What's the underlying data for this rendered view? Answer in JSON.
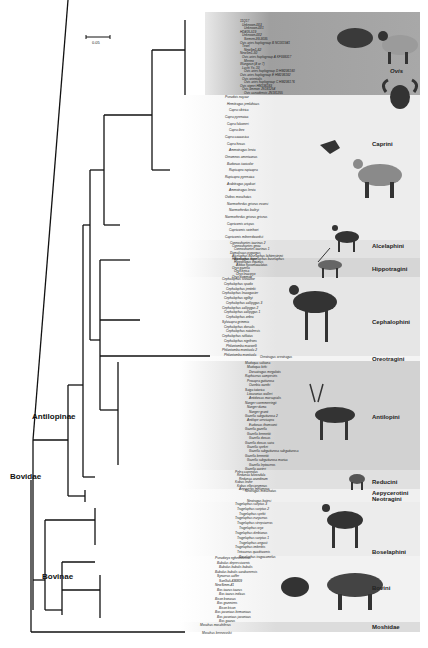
{
  "figure": {
    "scale_bar": {
      "label": "0.05"
    },
    "major_labels": {
      "bovidae": "Bovidae",
      "antilopinae": "Antilopinae",
      "bovinae": "Bovinae"
    },
    "clades": [
      {
        "name": "Ovis",
        "top": 12,
        "bottom": 95,
        "shade": "#9a9a9a",
        "label_y": 68,
        "italic": true
      },
      {
        "name": "Caprini",
        "top": 95,
        "bottom": 240,
        "shade": "#ededed",
        "label_y": 141
      },
      {
        "name": "Alcelaphini",
        "top": 240,
        "bottom": 258,
        "shade": "#e2e2e2",
        "label_y": 243
      },
      {
        "name": "Hippotragini",
        "top": 258,
        "bottom": 277,
        "shade": "#d6d6d6",
        "label_y": 266
      },
      {
        "name": "Cephalophini",
        "top": 277,
        "bottom": 356,
        "shade": "#e6e6e6",
        "label_y": 319
      },
      {
        "name": "Oreotragini",
        "top": 356,
        "bottom": 361,
        "shade": "#f4f4f4",
        "label_y": 356
      },
      {
        "name": "Antilopini",
        "top": 361,
        "bottom": 470,
        "shade": "#d2d2d2",
        "label_y": 414
      },
      {
        "name": "Reducini",
        "top": 470,
        "bottom": 489,
        "shade": "#e0e0e0",
        "label_y": 479
      },
      {
        "name": "Aepycerotini",
        "top": 489,
        "bottom": 496,
        "shade": "#f0f0f0",
        "label_y": 490
      },
      {
        "name": "Neotragini",
        "top": 496,
        "bottom": 502,
        "shade": "#f0f0f0",
        "label_y": 496
      },
      {
        "name": "Boselaphini",
        "top": 502,
        "bottom": 556,
        "shade": "#ececec",
        "label_y": 549
      },
      {
        "name": "Bovini",
        "top": 556,
        "bottom": 622,
        "shade": "#f2f2f2",
        "label_y": 585
      },
      {
        "name": "Moshidae",
        "top": 622,
        "bottom": 632,
        "shade": "#dcdcdc",
        "label_y": 624
      }
    ],
    "tips": {
      "ovis": [
        "11Q17",
        "Unknown-003",
        "Unknown-001",
        "HD405-519",
        "Unknown-002",
        "Siemen-99-9035",
        "Ovis aries haplogroup B NC001941",
        "Texel",
        "New5m1-62",
        "New5m1-50",
        "Ovis aries haplogroup A KF938317",
        "Merino",
        "Wangzan (4 or 7)",
        "Lushi Yo..10",
        "Ovis aries haplogroup D HM236180",
        "Ovis aries haplogroup E HM236182",
        "Ovis orientalis",
        "Ovis aries haplogroup C HM236176",
        "Ovis vignei HM236183",
        "Ovis ammon JN181254",
        "Ovis canadensis JN181255"
      ],
      "caprini": [
        "Pseudois nayaur",
        "Hemitragus jemlahicus",
        "Capra sibirica",
        "Capra pyrenaica",
        "Capra falconeri",
        "Capra ibex",
        "Capra caucasica",
        "Capra hircus",
        "Ammotragus lervia",
        "Oreamnos americanus",
        "Budorcas taxicolor",
        "Rupicapra rupicapra",
        "Rupicapra pyrenaica",
        "Arabitragus jayakari",
        "Ammotragus lervia",
        "Ovibos moschatus",
        "Naemorhedus griseus evansi",
        "Naemorhedus baileyi",
        "Naemorhedus griseus griseus",
        "Capricornis crispus",
        "Capricornis swinhoei",
        "Capricornis milneedwardsii"
      ],
      "alcelaphini": [
        "Connochaetes taurinus 2",
        "Connochaetes gnou",
        "Connochaetes taurinus 1",
        "Damaliscus pygargus",
        "Alcelaphus buselaphus lichtensteinii",
        "Alcelaphus buselaphus buselaphus"
      ],
      "hippotragini": [
        "Hippotragus niger",
        "Hippotragus equinus",
        "Addax nasomaculatus",
        "Oryx gazella",
        "Oryx beisa",
        "Oryx leucoryx",
        "Oryx dammah"
      ],
      "cephalophini": [
        "Cephalophus silvicultor",
        "Cephalophus spadix",
        "Cephalophus jentinki",
        "Cephalophus leucogaster",
        "Cephalophus ogilbyi",
        "Cephalophus callipygus 3",
        "Cephalophus callipygus 2",
        "Cephalophus callipygus 1",
        "Cephalophus zebra",
        "Sylvicapra grimmia",
        "Cephalophus dorsalis",
        "Cephalophus natalensis",
        "Cephalophus rufilatus",
        "Cephalophus nigrifrons",
        "Philantomba maxwelli",
        "Philantomba monticola 2",
        "Philantomba monticola"
      ],
      "oreotragini": [
        "Oreotragus oreotragus"
      ],
      "antilopini": [
        "Madoqua saltiana",
        "Madoqua kirki",
        "Dorcatragus megalotis",
        "Raphicerus campestris",
        "Procapra gutturosa",
        "Ourebia ourebi",
        "Saiga tatarica",
        "Litocranius walleri",
        "Antidorcas marsupialis",
        "Nanger soemmerringii",
        "Nanger dama",
        "Nanger granti",
        "Gazella subgutturosa 2",
        "Antilope cervicapra",
        "Eudorcas thomsonii",
        "Gazella gazella",
        "Gazella bennettii",
        "Gazella dorcas",
        "Gazella dorcas saira",
        "Gazella spekei",
        "Gazella subgutturosa subgutturosa",
        "Gazella bennettii",
        "Gazella subgutturosa marica",
        "Gazella leptoceros",
        "Gazella cuvieri"
      ],
      "reducini": [
        "Pelea capreolus",
        "Redunca fulvorufula",
        "Redunca arundinum",
        "Kobus leche",
        "Kobus ellipsiprymnus",
        "Aepyceros melampus"
      ],
      "neotragini": [
        "Neotragus moschatus",
        "Neotragus batesi"
      ],
      "boselaphini": [
        "Tragelaphus scriptus 3",
        "Tragelaphus scriptus 2",
        "Tragelaphus spekii",
        "Tragelaphus eurycerus",
        "Tragelaphus strepsiceros",
        "Tragelaphus oryx",
        "Tragelaphus derbianus",
        "Tragelaphus scriptus 1",
        "Tragelaphus angasii",
        "Tragelaphus imberbis",
        "Tetracerus quadricornis",
        "Boselaphus tragocamelus"
      ],
      "bovini": [
        "Pseudoryx nghetinhensis",
        "Bubalus depressicornis",
        "Bubalus bubalis bubalis",
        "Bubalus bubalis carabanensis",
        "Syncerus caffer",
        "SanGuli-436809",
        "NewSimm-41",
        "Bos taurus taurus",
        "Bos taurus indicus",
        "Bison bonasus",
        "Bos grunniens",
        "Bison bison",
        "Bos javanicus birmanicus",
        "Bos javanicus javanicus",
        "Bos gaurus"
      ],
      "moshidae": [
        "Moschus moschiferus",
        "Moschus berezovskii"
      ]
    },
    "support_values": [
      "1.0/100",
      "1.0/100",
      "1.0/100",
      "0.96/77",
      "1.0/100",
      "0.97/79",
      "1.0/98",
      "1.0/100",
      "1.0/100",
      "0.94/81",
      "1.0/100",
      "0.89/100",
      "0.79/68",
      "3.97/100",
      "1.0/100",
      "1.0/100",
      "0.98/84",
      "1.0/100",
      "0.97/79",
      "1.0/95"
    ]
  }
}
